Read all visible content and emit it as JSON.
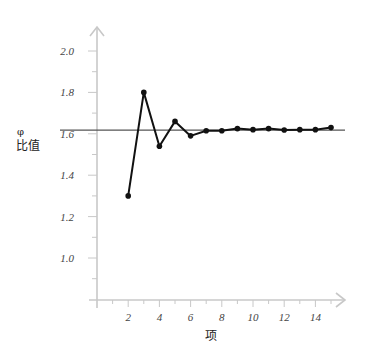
{
  "chart_data": {
    "type": "line",
    "title": "",
    "xlabel": "项",
    "ylabel_symbol": "φ",
    "ylabel": "比值",
    "x": [
      2,
      3,
      4,
      5,
      6,
      7,
      8,
      9,
      10,
      11,
      12,
      13,
      14,
      15
    ],
    "series": [
      {
        "name": "相邻项比值",
        "values": [
          1.3,
          1.8,
          1.54,
          1.66,
          1.59,
          1.615,
          1.615,
          1.625,
          1.62,
          1.625,
          1.618,
          1.62,
          1.62,
          1.63
        ],
        "color": "#111111",
        "marker": "circle"
      }
    ],
    "reference_lines": [
      {
        "name": "φ",
        "y": 1.618,
        "color": "#555555"
      }
    ],
    "xticks": [
      2,
      4,
      6,
      8,
      10,
      12,
      14
    ],
    "xtick_labels": [
      "2",
      "4",
      "6",
      "8",
      "10",
      "12",
      "14"
    ],
    "yticks": [
      1.0,
      1.2,
      1.4,
      1.6,
      1.8,
      2.0
    ],
    "ytick_labels": [
      "1.0",
      "1.2",
      "1.4",
      "1.6",
      "1.8",
      "2.0"
    ],
    "xlim": [
      0,
      16
    ],
    "ylim": [
      0.8,
      2.1
    ],
    "grid": false,
    "legend": null,
    "axis_color": "#c8c8c8"
  },
  "labels": {
    "y_symbol": "φ",
    "y_text": "比值",
    "x_text": "项"
  }
}
